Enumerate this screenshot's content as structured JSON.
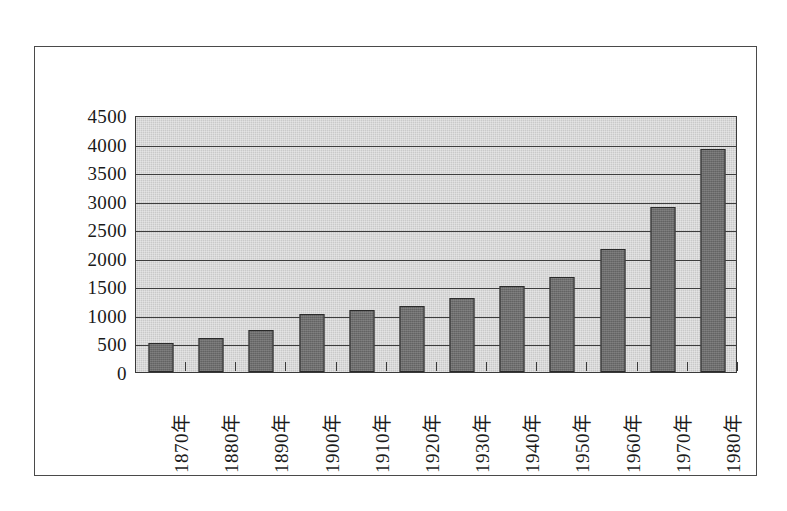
{
  "chart_data": {
    "type": "bar",
    "title": "",
    "subtitle": "",
    "xlabel": "",
    "ylabel": "",
    "categories": [
      "1870年",
      "1880年",
      "1890年",
      "1900年",
      "1910年",
      "1920年",
      "1930年",
      "1940年",
      "1950年",
      "1960年",
      "1970年",
      "1980年"
    ],
    "values": [
      500,
      590,
      730,
      1020,
      1090,
      1160,
      1290,
      1500,
      1660,
      2150,
      2890,
      3910
    ],
    "series": [
      {
        "name": "",
        "values": [
          500,
          590,
          730,
          1020,
          1090,
          1160,
          1290,
          1500,
          1660,
          2150,
          2890,
          3910
        ]
      }
    ],
    "ylim": [
      0,
      4500
    ],
    "y_ticks": [
      0,
      500,
      1000,
      1500,
      2000,
      2500,
      3000,
      3500,
      4000,
      4500
    ],
    "y_tick_labels": [
      "0",
      "500",
      "1000",
      "1500",
      "2000",
      "2500",
      "3000",
      "3500",
      "4000",
      "4500"
    ],
    "grid": true,
    "grid_axis": "y",
    "legend": false,
    "legend_position": "none",
    "x_tick_rotation": 90,
    "annotations": []
  },
  "style": {
    "plot_background": "#c9c9c9",
    "bar_fill": "#6e6e6e",
    "bar_border": "#2a2a2a",
    "gridline_color": "#3d3d3d",
    "frame_border": "#4a4a4a",
    "text_color": "#1a1a1a",
    "page_background": "#ffffff"
  }
}
